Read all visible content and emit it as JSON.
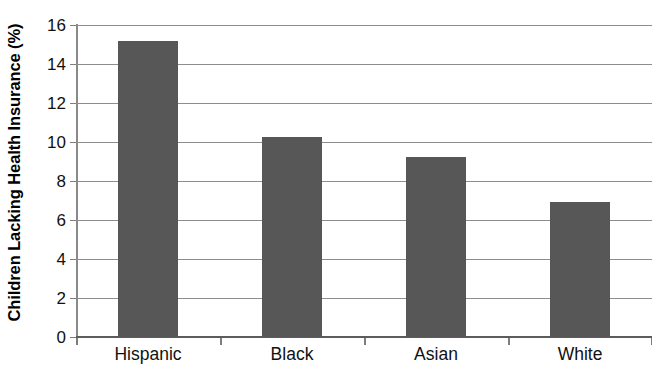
{
  "chart_data": {
    "type": "bar",
    "title": "",
    "subtitle": "",
    "xlabel": "",
    "ylabel": "Children Lacking Health Insurance (%)",
    "categories": [
      "Hispanic",
      "Black",
      "Asian",
      "White"
    ],
    "values": [
      15.15,
      10.25,
      9.2,
      6.9
    ],
    "ylim": [
      0,
      16
    ],
    "ytick_labels": [
      "0",
      "2",
      "4",
      "6",
      "8",
      "10",
      "12",
      "14",
      "16"
    ],
    "ytick_values": [
      0,
      2,
      4,
      6,
      8,
      10,
      12,
      14,
      16
    ],
    "grid": "horizontal",
    "legend": "none",
    "bar_color": "#575757",
    "gridline_color": "#8d8d8d",
    "axis_color": "#5c5c5c",
    "background_color": "#ffffff",
    "annotations": []
  }
}
